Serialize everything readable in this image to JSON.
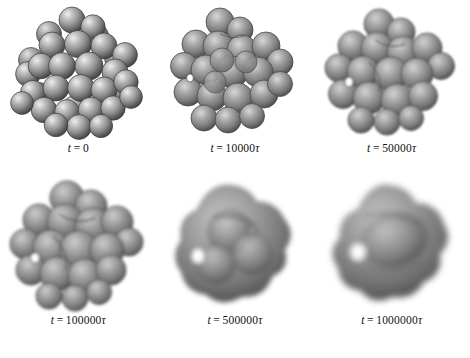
{
  "figure": {
    "background_color": "#ffffff",
    "type": "simulation-snapshot-series",
    "rows": 2,
    "columns": 3,
    "surface_color": "#8a8a8a",
    "highlight_color": "#e8e8e8",
    "shadow_color": "#2e2e2e",
    "outline_color": "#3a3a3a"
  },
  "panels": [
    {
      "id": "panel-1",
      "time_value": "0",
      "has_tau": false,
      "caption_var": "t",
      "caption_eq": "=",
      "caption_tau": "",
      "morphology": "discrete-spheres",
      "smoothness": 0.0,
      "visible_pores": 0
    },
    {
      "id": "panel-2",
      "time_value": "10000",
      "has_tau": true,
      "caption_var": "t",
      "caption_eq": "=",
      "caption_tau": "τ",
      "morphology": "fused-spheres",
      "smoothness": 0.25,
      "visible_pores": 1
    },
    {
      "id": "panel-3",
      "time_value": "50000",
      "has_tau": true,
      "caption_var": "t",
      "caption_eq": "=",
      "caption_tau": "τ",
      "morphology": "lobed-surface",
      "smoothness": 0.45,
      "visible_pores": 1
    },
    {
      "id": "panel-4",
      "time_value": "100000",
      "has_tau": true,
      "caption_var": "t",
      "caption_eq": "=",
      "caption_tau": "τ",
      "morphology": "coarse-lobed-surface",
      "smoothness": 0.62,
      "visible_pores": 1
    },
    {
      "id": "panel-5",
      "time_value": "500000",
      "has_tau": true,
      "caption_var": "t",
      "caption_eq": "=",
      "caption_tau": "τ",
      "morphology": "smooth-blob-with-pore",
      "smoothness": 0.85,
      "visible_pores": 2
    },
    {
      "id": "panel-6",
      "time_value": "1000000",
      "has_tau": true,
      "caption_var": "t",
      "caption_eq": "=",
      "caption_tau": "τ",
      "morphology": "smooth-torus-like",
      "smoothness": 1.0,
      "visible_pores": 1
    }
  ],
  "figure_caption": {
    "visible": true,
    "cropped": true,
    "text": ""
  }
}
